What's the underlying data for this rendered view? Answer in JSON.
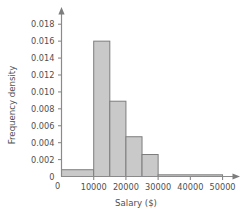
{
  "chart_data": {
    "type": "bar",
    "title": "",
    "subtitle": "",
    "xlabel": "Salary ($)",
    "ylabel": "Frequency density",
    "grid": false,
    "legend": "none",
    "xlim": [
      0,
      52000
    ],
    "ylim": [
      0,
      0.0185
    ],
    "x_ticks": [
      0,
      10000,
      20000,
      30000,
      40000,
      50000
    ],
    "x_tick_labels": [
      "0",
      "10000",
      "20000",
      "30000",
      "40000",
      "50000"
    ],
    "y_ticks": [
      0,
      0.002,
      0.004,
      0.006,
      0.008,
      0.01,
      0.012,
      0.014,
      0.016,
      0.018
    ],
    "y_tick_labels": [
      "0",
      "0.002",
      "0.004",
      "0.006",
      "0.008",
      "0.010",
      "0.012",
      "0.014",
      "0.016",
      "0.018"
    ],
    "bin_edges": [
      0,
      10000,
      15000,
      20000,
      25000,
      30000,
      50000
    ],
    "values": [
      0.0008,
      0.016,
      0.0089,
      0.0047,
      0.0026,
      0.0002
    ],
    "bars": [
      {
        "x0": 0,
        "x1": 10000,
        "density": 0.0008
      },
      {
        "x0": 10000,
        "x1": 15000,
        "density": 0.016
      },
      {
        "x0": 15000,
        "x1": 20000,
        "density": 0.0089
      },
      {
        "x0": 20000,
        "x1": 25000,
        "density": 0.0047
      },
      {
        "x0": 25000,
        "x1": 30000,
        "density": 0.0026
      },
      {
        "x0": 30000,
        "x1": 50000,
        "density": 0.0002
      }
    ],
    "colors": {
      "bar_fill": "#c9c9c9",
      "bar_stroke": "#7d7d7d",
      "axis": "#8a8a8a",
      "text": "#4f4f4f",
      "background": "#ffffff"
    }
  }
}
